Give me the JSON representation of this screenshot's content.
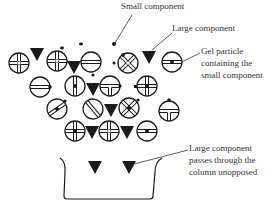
{
  "diagram": {
    "labels": {
      "small_component": "Small component",
      "large_component": "Large component",
      "gel_particle_line1": "Gel particle",
      "gel_particle_line2": "containing the",
      "gel_particle_line3": "small component",
      "passes_line1": "Large component",
      "passes_line2": "passes through the",
      "passes_line3": "column unopposed"
    },
    "colors": {
      "ink": "#1a1a1a",
      "text": "#333333",
      "background": "#ffffff"
    }
  }
}
